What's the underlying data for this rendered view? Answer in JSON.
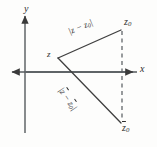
{
  "figure": {
    "background_color": "#fdfdfc",
    "ink_color": "#3a3a3a",
    "axes": {
      "x_label": "x",
      "y_label": "y",
      "origin": {
        "x": 25,
        "y": 72
      },
      "x_range_px": [
        8,
        138
      ],
      "y_range_px": [
        13,
        133
      ]
    },
    "points": [
      {
        "name": "z",
        "label": "z",
        "x": 58,
        "y": 58
      },
      {
        "name": "z0",
        "label": "z",
        "subscript": "0",
        "x": 122,
        "y": 30
      },
      {
        "name": "z0-conjugate",
        "label": "z",
        "subscript": "0",
        "overline": true,
        "x": 122,
        "y": 123
      }
    ],
    "segments": [
      {
        "name": "z-to-z0",
        "label": "|z − z₀|",
        "from": "z",
        "to": "z0",
        "style": "solid"
      },
      {
        "name": "z-to-z0-conjugate",
        "label": "|z̄ − z̄₀|",
        "from": "z",
        "to": "z0-conjugate",
        "style": "solid"
      },
      {
        "name": "z0-to-z0-conjugate",
        "label": "",
        "from": "z0",
        "to": "z0-conjugate",
        "style": "dashed"
      }
    ],
    "labels": {
      "y_axis": "y",
      "x_axis": "x",
      "vertex_z": "z",
      "point_z0_top_base": "z",
      "point_z0_top_sub": "0",
      "point_z0_bottom_base": "z",
      "point_z0_bottom_sub": "0",
      "distance_upper_open": "|",
      "distance_upper_base1": "z",
      "distance_upper_minus": " − ",
      "distance_upper_base2": "z",
      "distance_upper_sub2": "0",
      "distance_upper_close": "|",
      "distance_lower_open": "|",
      "distance_lower_base1": "z",
      "distance_lower_minus": " − ",
      "distance_lower_base2": "z",
      "distance_lower_sub2": "0",
      "distance_lower_close": "|"
    }
  }
}
